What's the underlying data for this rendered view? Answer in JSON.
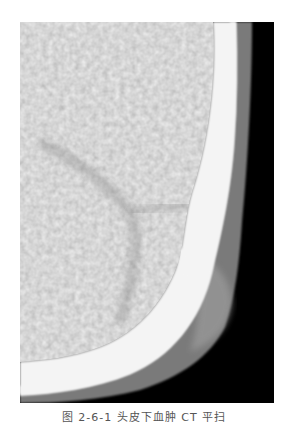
{
  "figure": {
    "colors": {
      "background": "#000000",
      "bone": "#f4f4f4",
      "brain": "#a9a9a9",
      "brain_dark": "#8e8e8e",
      "soft_tissue": "#6e6e6e",
      "page": "#ffffff"
    }
  },
  "caption": {
    "text": "图 2-6-1  头皮下血肿 CT 平扫"
  }
}
